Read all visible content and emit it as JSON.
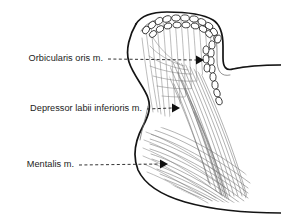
{
  "figure": {
    "background_color": "#ffffff",
    "width": 281,
    "height": 224
  },
  "colors": {
    "outline_major": "#141414",
    "outline_minor": "#6e6e6e",
    "fiber": "#7b7b7b",
    "bone_shade": "#ebebeb",
    "bone_shade_deep": "#e0e0e0",
    "label_text": "#1c1c1c",
    "leader_line": "#1c1c1c",
    "arrowhead": "#111111",
    "orbicularis_fill": "#ffffff"
  },
  "labels": [
    {
      "id": "orbicularis-oris",
      "text": "Orbicularis oris m.",
      "text_x": 103,
      "text_y": 59,
      "leader_start_x": 108,
      "leader_start_y": 59,
      "leader_end_x": 196,
      "leader_end_y": 60,
      "arrow_tip_x": 203,
      "arrow_tip_y": 60
    },
    {
      "id": "depressor-labii-inferioris",
      "text": "Depressor labii inferioris m.",
      "text_x": 142,
      "text_y": 109,
      "leader_start_x": 147,
      "leader_start_y": 109,
      "leader_end_x": 172,
      "leader_end_y": 108,
      "arrow_tip_x": 180,
      "arrow_tip_y": 108
    },
    {
      "id": "mentalis",
      "text": "Mentalis m.",
      "text_x": 74,
      "text_y": 165,
      "leader_start_x": 79,
      "leader_start_y": 165,
      "leader_end_x": 160,
      "leader_end_y": 164,
      "arrow_tip_x": 168,
      "arrow_tip_y": 164
    }
  ],
  "structures": [
    {
      "id": "orbicularis-oris",
      "name": "Orbicularis oris m.",
      "rendering": "chain of cut muscle-fiber ovals following the vermilion border",
      "oval_count": 31
    },
    {
      "id": "depressor-labii-inferioris",
      "name": "Depressor labii inferioris m.",
      "rendering": "fiber bundle fanning from lip inferolaterally, crossing mentalis"
    },
    {
      "id": "mentalis",
      "name": "Mentalis m.",
      "rendering": "fiber bundle running from chin skin superomedially, crossing depressor"
    },
    {
      "id": "mandible",
      "name": "mandible (shaded bone)",
      "rendering": "light gray shaded mass at right of section"
    },
    {
      "id": "lip-skin-outline",
      "name": "skin and mucosal profile of lower lip and chin",
      "rendering": "heavy black contour"
    }
  ]
}
